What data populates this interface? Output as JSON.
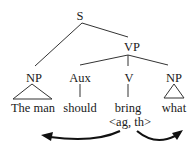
{
  "tree": {
    "root": "S",
    "vp": "VP",
    "np_subject": "NP",
    "aux": "Aux",
    "verb": "V",
    "np_object": "NP"
  },
  "words": {
    "subject": "The man",
    "aux": "should",
    "verb": "bring",
    "object": "what"
  },
  "argument_structure": "<ag, th>",
  "arrows": [
    {
      "from": "verb",
      "to": "subject",
      "direction": "left"
    },
    {
      "from": "verb",
      "to": "object",
      "direction": "right"
    }
  ]
}
